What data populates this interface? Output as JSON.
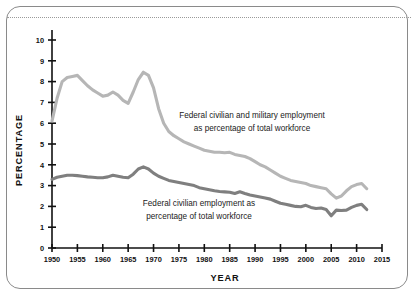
{
  "card": {
    "background": "#ffffff",
    "border_color": "#8a8a8a"
  },
  "divider": {
    "style": "dotted",
    "color": "#9a9a9a"
  },
  "chart_data": {
    "type": "line",
    "title": "",
    "xlabel": "YEAR",
    "ylabel": "PERCENTAGE",
    "xlim": [
      1950,
      2015
    ],
    "ylim": [
      0,
      10
    ],
    "grid": false,
    "legend_position": "inline-annotation",
    "xticks": [
      1950,
      1955,
      1960,
      1965,
      1970,
      1975,
      1980,
      1985,
      1990,
      1995,
      2000,
      2005,
      2010,
      2015
    ],
    "xtick_labels": [
      "1950",
      "1955",
      "1960",
      "1965",
      "1970",
      "1975",
      "1980",
      "1985",
      "1990",
      "1995",
      "2000",
      "2005",
      "2010",
      "2015"
    ],
    "yticks": [
      0,
      1,
      2,
      3,
      4,
      5,
      6,
      7,
      8,
      9,
      10
    ],
    "ytick_labels": [
      "0",
      "1",
      "2",
      "3",
      "4",
      "5",
      "6",
      "7",
      "8",
      "9",
      "10"
    ],
    "series": [
      {
        "name": "Federal civilian and military employment as percentage of total workforce",
        "color": "#b6b6b6",
        "x": [
          1950,
          1951,
          1952,
          1953,
          1954,
          1955,
          1956,
          1957,
          1958,
          1959,
          1960,
          1961,
          1962,
          1963,
          1964,
          1965,
          1966,
          1967,
          1968,
          1969,
          1970,
          1971,
          1972,
          1973,
          1974,
          1975,
          1976,
          1977,
          1978,
          1979,
          1980,
          1981,
          1982,
          1983,
          1984,
          1985,
          1986,
          1987,
          1988,
          1989,
          1990,
          1991,
          1992,
          1993,
          1994,
          1995,
          1996,
          1997,
          1998,
          1999,
          2000,
          2001,
          2002,
          2003,
          2004,
          2005,
          2006,
          2007,
          2008,
          2009,
          2010,
          2011,
          2012
        ],
        "values": [
          6.1,
          7.2,
          8.0,
          8.2,
          8.25,
          8.3,
          8.05,
          7.8,
          7.6,
          7.45,
          7.3,
          7.35,
          7.5,
          7.35,
          7.1,
          6.95,
          7.5,
          8.1,
          8.45,
          8.3,
          7.7,
          6.7,
          6.0,
          5.6,
          5.4,
          5.25,
          5.1,
          5.0,
          4.9,
          4.8,
          4.7,
          4.65,
          4.6,
          4.6,
          4.58,
          4.6,
          4.5,
          4.45,
          4.4,
          4.3,
          4.15,
          4.0,
          3.9,
          3.75,
          3.6,
          3.45,
          3.35,
          3.25,
          3.2,
          3.15,
          3.1,
          3.0,
          2.95,
          2.9,
          2.85,
          2.6,
          2.4,
          2.5,
          2.75,
          2.95,
          3.05,
          3.1,
          2.85
        ]
      },
      {
        "name": "Federal civilian employment as percentage of total workforce",
        "color": "#7f7f7f",
        "x": [
          1950,
          1951,
          1952,
          1953,
          1954,
          1955,
          1956,
          1957,
          1958,
          1959,
          1960,
          1961,
          1962,
          1963,
          1964,
          1965,
          1966,
          1967,
          1968,
          1969,
          1970,
          1971,
          1972,
          1973,
          1974,
          1975,
          1976,
          1977,
          1978,
          1979,
          1980,
          1981,
          1982,
          1983,
          1984,
          1985,
          1986,
          1987,
          1988,
          1989,
          1990,
          1991,
          1992,
          1993,
          1994,
          1995,
          1996,
          1997,
          1998,
          1999,
          2000,
          2001,
          2002,
          2003,
          2004,
          2005,
          2006,
          2007,
          2008,
          2009,
          2010,
          2011,
          2012
        ],
        "values": [
          3.3,
          3.4,
          3.45,
          3.5,
          3.5,
          3.48,
          3.45,
          3.42,
          3.4,
          3.38,
          3.38,
          3.42,
          3.5,
          3.45,
          3.4,
          3.38,
          3.55,
          3.8,
          3.9,
          3.8,
          3.6,
          3.45,
          3.35,
          3.25,
          3.2,
          3.15,
          3.1,
          3.05,
          3.0,
          2.9,
          2.85,
          2.8,
          2.75,
          2.72,
          2.7,
          2.68,
          2.62,
          2.7,
          2.62,
          2.55,
          2.5,
          2.45,
          2.4,
          2.35,
          2.25,
          2.15,
          2.1,
          2.05,
          2.0,
          1.98,
          2.05,
          1.95,
          1.9,
          1.92,
          1.85,
          1.55,
          1.82,
          1.8,
          1.82,
          1.95,
          2.05,
          2.1,
          1.85
        ]
      }
    ],
    "annotations": [
      {
        "id": "upper-series-annotation",
        "line1": "Federal civilian and military employment",
        "line2": "as percentage of total workforce"
      },
      {
        "id": "lower-series-annotation",
        "line1": "Federal civilian employment as",
        "line2": "percentage of total workforce"
      }
    ]
  }
}
